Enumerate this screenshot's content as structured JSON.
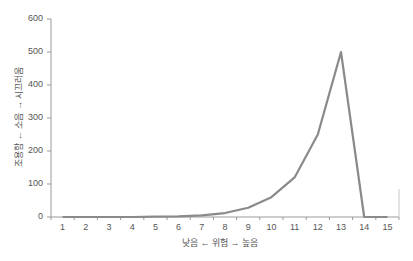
{
  "chart_data": {
    "type": "line",
    "title": "",
    "xlabel": "낮음 ← 위험 → 높음",
    "ylabel": "조용함 ← 소음 → 시끄러움",
    "categories": [
      "1",
      "2",
      "3",
      "4",
      "5",
      "6",
      "7",
      "8",
      "9",
      "10",
      "11",
      "12",
      "13",
      "14",
      "15"
    ],
    "series": [
      {
        "name": "소음",
        "values": [
          0,
          0,
          0,
          0,
          1,
          2,
          5,
          12,
          28,
          60,
          120,
          250,
          500,
          0,
          0
        ]
      }
    ],
    "ylim": [
      0,
      600
    ],
    "yticks": [
      0,
      100,
      200,
      300,
      400,
      500,
      600
    ],
    "grid": false,
    "legend": "none",
    "line_color": "#8a8a8a"
  },
  "axes": {
    "y_ticks": [
      "0",
      "100",
      "200",
      "300",
      "400",
      "500",
      "600"
    ],
    "x_ticks": [
      "1",
      "2",
      "3",
      "4",
      "5",
      "6",
      "7",
      "8",
      "9",
      "10",
      "11",
      "12",
      "13",
      "14",
      "15"
    ],
    "x_label": "낮음 ← 위험 → 높음",
    "y_label": "조용함 ← 소음 → 시끄러움"
  }
}
